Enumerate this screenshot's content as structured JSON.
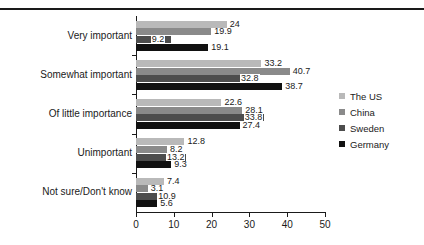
{
  "chart_data": {
    "type": "bar",
    "orientation": "horizontal",
    "title": "",
    "xlabel": "",
    "ylabel": "",
    "xlim": [
      0,
      50
    ],
    "xticks": [
      0,
      10,
      20,
      30,
      40,
      50
    ],
    "grid": false,
    "legend_position": "right",
    "categories": [
      "Very important",
      "Somewhat important",
      "Of little importance",
      "Unimportant",
      "Not sure/Don't know"
    ],
    "series": [
      {
        "name": "The US",
        "color": "#b9b9b9",
        "values": [
          24,
          33.2,
          22.6,
          12.8,
          7.4
        ]
      },
      {
        "name": "China",
        "color": "#8a8a8a",
        "values": [
          19.9,
          40.7,
          28.1,
          8.2,
          3.1
        ]
      },
      {
        "name": "Sweden",
        "color": "#4d4d4d",
        "values": [
          9.2,
          32.8,
          33.8,
          13.2,
          10.9
        ]
      },
      {
        "name": "Germany",
        "color": "#111111",
        "values": [
          19.1,
          38.7,
          27.4,
          9.3,
          5.6
        ]
      }
    ],
    "value_labels": [
      [
        "24",
        "19.9",
        "9.2",
        "19.1"
      ],
      [
        "33.2",
        "40.7",
        "32.8",
        "38.7"
      ],
      [
        "22.6",
        "28.1",
        "33.8",
        "27.4"
      ],
      [
        "12.8",
        "8.2",
        "13.2",
        "9.3"
      ],
      [
        "7.4",
        "3.1",
        "10.9",
        "5.6"
      ]
    ]
  },
  "legend": {
    "items": [
      {
        "label": "The US"
      },
      {
        "label": "China"
      },
      {
        "label": "Sweden"
      },
      {
        "label": "Germany"
      }
    ]
  },
  "axis": {
    "x_tick_labels": [
      "0",
      "10",
      "20",
      "30",
      "40",
      "50"
    ]
  }
}
